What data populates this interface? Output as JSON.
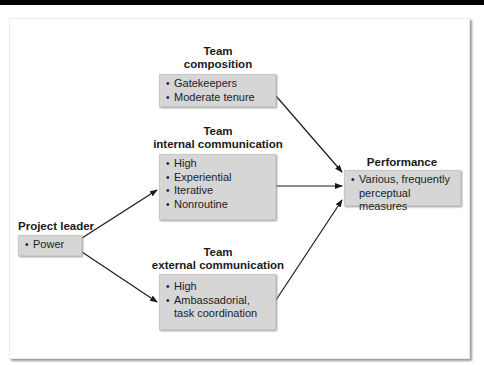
{
  "diagram": {
    "nodes": {
      "project_leader": {
        "title": "Project leader",
        "items": [
          "Power"
        ]
      },
      "team_composition": {
        "title_line1": "Team",
        "title_line2": "composition",
        "items": [
          "Gatekeepers",
          "Moderate tenure"
        ]
      },
      "team_internal": {
        "title_line1": "Team",
        "title_line2": "internal communication",
        "items": [
          "High",
          "Experiential",
          "Iterative",
          "Nonroutine"
        ]
      },
      "team_external": {
        "title_line1": "Team",
        "title_line2": "external communication",
        "items": [
          "High",
          "Ambassadorial,",
          "task coordination"
        ]
      },
      "performance": {
        "title": "Performance",
        "items": [
          "Various, frequently",
          "perceptual measures"
        ]
      }
    },
    "edges": [
      {
        "from": "project_leader",
        "to": "team_internal"
      },
      {
        "from": "project_leader",
        "to": "team_external"
      },
      {
        "from": "team_composition",
        "to": "performance"
      },
      {
        "from": "team_internal",
        "to": "performance"
      },
      {
        "from": "team_external",
        "to": "performance"
      }
    ],
    "colors": {
      "box_fill": "#d6d6d6",
      "arrow": "#1a1a1a",
      "text": "#1a1a1a"
    }
  }
}
